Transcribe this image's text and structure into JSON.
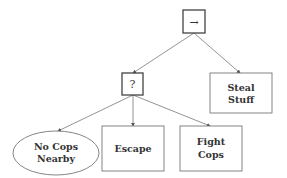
{
  "diagram": {
    "type": "behavior-tree",
    "colors": {
      "stroke": "#555555",
      "text": "#333333",
      "background": "#ffffff"
    },
    "nodes": {
      "root": {
        "kind": "sequence",
        "symbol": "→"
      },
      "fallback": {
        "kind": "fallback",
        "symbol": "?"
      },
      "steal": {
        "kind": "action",
        "line1": "Steal",
        "line2": "Stuff"
      },
      "no_cops": {
        "kind": "condition",
        "line1": "No Cops",
        "line2": "Nearby"
      },
      "escape": {
        "kind": "action",
        "label": "Escape"
      },
      "fight": {
        "kind": "action",
        "line1": "Fight",
        "line2": "Cops"
      }
    },
    "edges": [
      {
        "from": "root",
        "to": "fallback"
      },
      {
        "from": "root",
        "to": "steal"
      },
      {
        "from": "fallback",
        "to": "no_cops"
      },
      {
        "from": "fallback",
        "to": "escape"
      },
      {
        "from": "fallback",
        "to": "fight"
      }
    ]
  }
}
